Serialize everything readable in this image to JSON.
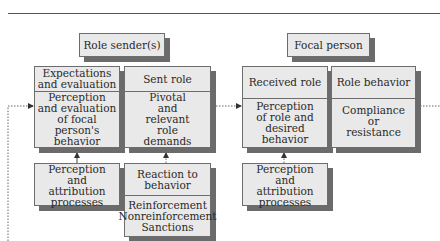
{
  "caption_fragment": "",
  "groups": {
    "role_sender": {
      "label": "Role sender(s)"
    },
    "focal_person": {
      "label": "Focal person"
    }
  },
  "boxes": {
    "expectations": {
      "header": "Expectations and evaluation",
      "body": "Perception and evaluation of focal person's behavior"
    },
    "sent_role": {
      "header": "Sent role",
      "body": "Pivotal and relevant role demands"
    },
    "received_role": {
      "header": "Received role",
      "body": "Perception of role and desired behavior"
    },
    "role_behavior": {
      "header": "Role behavior",
      "body": "Compliance or resistance"
    },
    "sender_perception": {
      "body": "Perception and attribution processes"
    },
    "reaction": {
      "header": "Reaction to behavior",
      "body": "Reinforcement Nonreinforcement Sanctions"
    },
    "focal_perception": {
      "body": "Perception and attribution processes"
    }
  },
  "colors": {
    "box_fill": "#e9e9e9",
    "border": "#6d6d6d",
    "shadow": "#6b6b6b",
    "line": "#555555"
  }
}
